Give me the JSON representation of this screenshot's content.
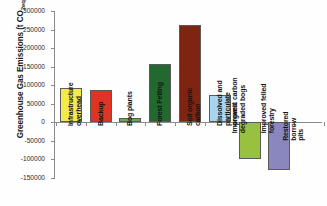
{
  "chart_data": {
    "type": "bar",
    "title": "",
    "xlabel": "",
    "ylabel": "Greenhouse Gas Emissions (t CO2eq)",
    "ylabel_main": "Greenhouse Gas Emissions (t CO",
    "ylabel_sub": "2eq",
    "ylabel_tail": ")",
    "ylim": [
      -150000,
      300000
    ],
    "ytick_step": 50000,
    "grid": false,
    "legend": "none",
    "categories": [
      "Infrastructure\noverhead",
      "Backup",
      "Bog plants",
      "Forest Felling",
      "Soil organic\ncarbon",
      "Dissolved and\nparticulate\norganic carbon",
      "Improved\ndegraded bogs",
      "Improved felled\nforestry",
      "Restored borrow\npits"
    ],
    "values": [
      92000,
      87000,
      13000,
      157000,
      262000,
      75000,
      -98000,
      -128000,
      0
    ],
    "colors": [
      "#f2ea50",
      "#e03325",
      "#6aa84f",
      "#23682f",
      "#7e2410",
      "#a9d5ee",
      "#97c13e",
      "#8a86be",
      "#ffffff"
    ],
    "ytick_labels": [
      "300000",
      "250000",
      "200000",
      "150000",
      "100000",
      "50000",
      "0",
      "-50000",
      "-100000",
      "-150000"
    ],
    "ytick_values": [
      300000,
      250000,
      200000,
      150000,
      100000,
      50000,
      0,
      -50000,
      -100000,
      -150000
    ]
  }
}
